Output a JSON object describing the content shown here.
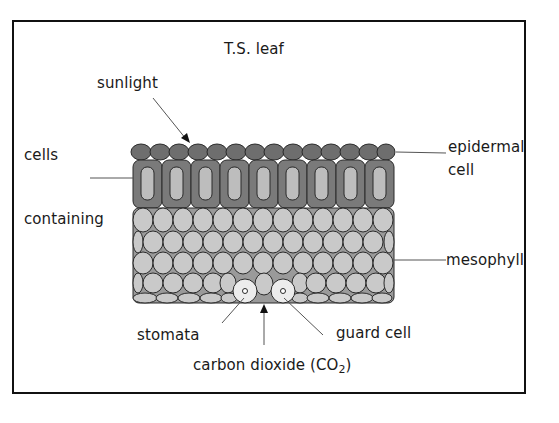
{
  "diagram": {
    "title": "T.S. leaf",
    "labels": {
      "sunlight": "sunlight",
      "cells": "cells",
      "containing": "containing",
      "epidermal_line1": "epidermal",
      "epidermal_line2": "cell",
      "mesophyll": "mesophyll",
      "stomata": "stomata",
      "guard_cell": "guard cell",
      "carbon_dioxide": "carbon dioxide (CO",
      "co2_subscript": "2",
      "carbon_dioxide_close": ")"
    },
    "colors": {
      "epidermis": "#6e6e6e",
      "palisade_outer": "#7a7a7a",
      "palisade_inner": "#bdbdbd",
      "mesophyll": "#c9c9c9",
      "guard_cell": "#ececec",
      "outline": "#2a2a2a"
    }
  }
}
